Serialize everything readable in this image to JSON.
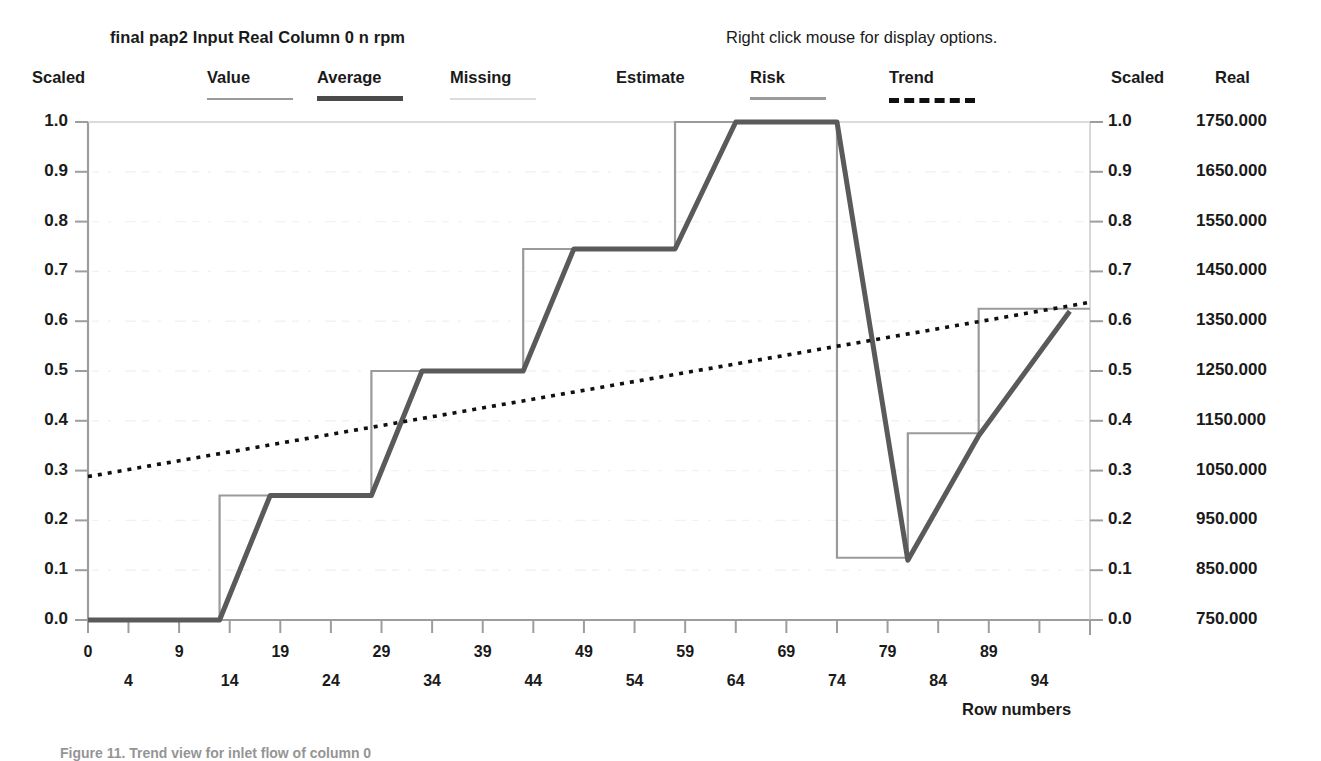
{
  "header": {
    "dataset_parts": [
      "final pap2",
      "Input",
      "Real",
      "Column 0",
      "n rpm"
    ],
    "dataset_title": "final pap2   Input Real Column 0  n rpm",
    "hint": "Right click mouse for display options."
  },
  "legend": {
    "left_axis_header": "Scaled",
    "right_axis_header": "Scaled",
    "real_axis_header": "Real",
    "items": [
      {
        "label": "Value",
        "swatch": "solid",
        "color": "#9a9a9a",
        "thickness": 2,
        "x": 207
      },
      {
        "label": "Average",
        "swatch": "solid",
        "color": "#4a4a4a",
        "thickness": 5,
        "x": 317
      },
      {
        "label": "Missing",
        "swatch": "solid",
        "color": "#d8d8d8",
        "thickness": 2,
        "x": 450
      },
      {
        "label": "Estimate",
        "swatch": "none",
        "color": "#9a9a9a",
        "thickness": 0,
        "x": 616
      },
      {
        "label": "Risk",
        "swatch": "solid",
        "color": "#9a9a9a",
        "thickness": 3,
        "x": 750
      },
      {
        "label": "Trend",
        "swatch": "dashed",
        "color": "#101010",
        "thickness": 5,
        "x": 889
      }
    ]
  },
  "axes": {
    "y_left_label": "Scaled",
    "y_right_label": "Scaled",
    "y_real_label": "Real",
    "x_title": "Row numbers",
    "y_scaled_ticks": [
      "1.0",
      "0.9",
      "0.8",
      "0.7",
      "0.6",
      "0.5",
      "0.4",
      "0.3",
      "0.2",
      "0.1",
      "0.0"
    ],
    "y_real_ticks": [
      "1750.000",
      "1650.000",
      "1550.000",
      "1450.000",
      "1350.000",
      "1250.000",
      "1150.000",
      "1050.000",
      "950.000",
      "850.000",
      "750.000"
    ],
    "x_ticks_upper": [
      "0",
      "9",
      "19",
      "29",
      "39",
      "49",
      "59",
      "69",
      "79",
      "89"
    ],
    "x_ticks_lower": [
      "4",
      "14",
      "24",
      "34",
      "44",
      "54",
      "64",
      "74",
      "84",
      "94"
    ]
  },
  "caption": "Figure 11. Trend view for inlet flow of column 0",
  "colors": {
    "value_line": "#9a9a9a",
    "average_line": "#5a5a5a",
    "missing_line": "#dddddd",
    "risk_line": "#9a9a9a",
    "trend_line": "#101010",
    "axis": "#9d9d9d",
    "grid": "#f0f0f0",
    "text": "#1a1a1a",
    "background": "#ffffff"
  },
  "chart_data": {
    "type": "line",
    "title": "final pap2   Input Real Column 0  n rpm",
    "xlabel": "Row numbers",
    "ylabel": "Scaled",
    "y2label": "Real",
    "xlim": [
      0,
      99
    ],
    "ylim": [
      0,
      1
    ],
    "y2lim": [
      750,
      1750
    ],
    "grid": false,
    "legend_position": "top",
    "series": [
      {
        "name": "Value",
        "style": "step",
        "color": "#9a9a9a",
        "x": [
          0,
          13,
          13,
          28,
          28,
          43,
          43,
          58,
          58,
          74,
          74,
          81,
          81,
          88,
          88,
          99
        ],
        "y": [
          0.0,
          0.0,
          0.25,
          0.25,
          0.5,
          0.5,
          0.745,
          0.745,
          1.0,
          1.0,
          0.125,
          0.125,
          0.375,
          0.375,
          0.625,
          0.625
        ]
      },
      {
        "name": "Average",
        "style": "line",
        "color": "#5a5a5a",
        "x": [
          0,
          13,
          18,
          28,
          33,
          43,
          48,
          58,
          64,
          74,
          81,
          88,
          97
        ],
        "y": [
          0.0,
          0.0,
          0.25,
          0.25,
          0.5,
          0.5,
          0.745,
          0.745,
          1.0,
          1.0,
          0.12,
          0.37,
          0.62
        ]
      },
      {
        "name": "Trend",
        "style": "dotted",
        "color": "#101010",
        "x": [
          0,
          99
        ],
        "y": [
          0.288,
          0.638
        ]
      }
    ]
  }
}
